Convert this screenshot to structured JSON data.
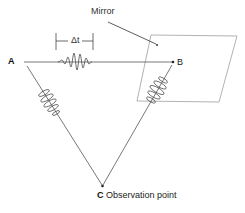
{
  "diagram": {
    "labels": {
      "mirror": "Mirror",
      "point_a": "A",
      "point_b": "B",
      "delta_t": "Δt",
      "point_c_letter": "C",
      "point_c_text": " Observation point"
    },
    "points": {
      "A": [
        22,
        62
      ],
      "B": [
        173,
        62
      ],
      "C": [
        102,
        186
      ]
    },
    "mirror_plane": [
      [
        151,
        35
      ],
      [
        237,
        36
      ],
      [
        219,
        102
      ],
      [
        137,
        101
      ]
    ],
    "colors": {
      "line": "#555555",
      "mirror": "#9a9a9a",
      "wave": "#444444",
      "text": "#222222"
    }
  }
}
